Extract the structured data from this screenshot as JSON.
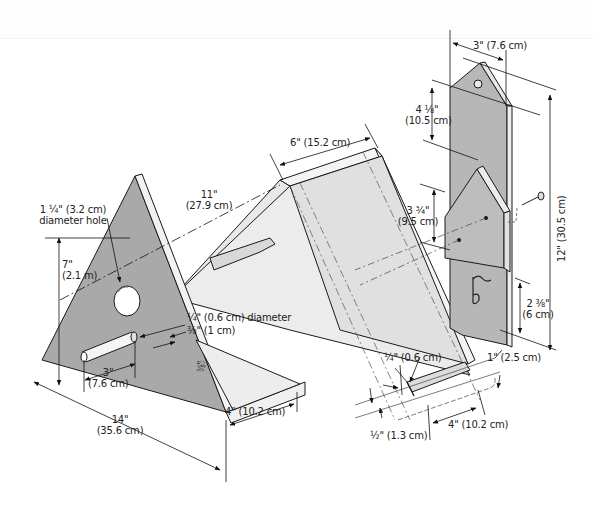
{
  "diagram": {
    "type": "exploded assembly drawing",
    "colors": {
      "side_panel": "#a9a9a9",
      "back_panel": "#b4b4b4",
      "roof_panel": "#e6e6e6",
      "edge": "#1a1a1a",
      "background": "#ffffff"
    },
    "parts": {
      "side_panel": {
        "hole_label_line1": "1 ¼\" (3.2 cm)",
        "hole_label_line2": "diameter hole",
        "height_line1": "7\"",
        "height_line2": "(2.1 m)",
        "base_line1": "14\"",
        "base_line2": "(35.6 cm)",
        "dowel_diameter": "¼\" (0.6 cm) diameter",
        "dowel_offset": "⅜\" (1 cm)",
        "dowel_length_line1": "3\"",
        "dowel_length_line2": "(7.6 cm)",
        "small_mark": "⅞\"",
        "floor_width": "4\" (10.2 cm)"
      },
      "roof": {
        "length_line1": "11\"",
        "length_line2": "(27.9 cm)",
        "width": "6\" (15.2 cm)"
      },
      "floor_strip": {
        "thickness": "¼\" (0.6 cm)",
        "height": "1\" (2.5 cm)",
        "width": "4\" (10.2 cm)",
        "offset": "½\" (1.3 cm)"
      },
      "back_panel": {
        "top_width": "3\" (7.6 cm)",
        "top_height_line1": "4 ⅛\"",
        "top_height_line2": "(10.5 cm)",
        "mid_height_line1": "3 ¾\"",
        "mid_height_line2": "(9.5 cm)",
        "total_height": "12\" (30.5 cm)",
        "bottom_height_line1": "2 ⅜\"",
        "bottom_height_line2": "(6 cm)"
      }
    }
  }
}
